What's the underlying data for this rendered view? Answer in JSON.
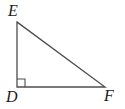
{
  "figure": {
    "kind": "right-triangle",
    "background_color": "#ffffff",
    "stroke_color": "#4d4d4d",
    "label_color": "#1a1a1a",
    "stroke_width": 1.3,
    "vertices": [
      {
        "name": "E",
        "label": "E",
        "x": 17,
        "y": 22
      },
      {
        "name": "D",
        "label": "D",
        "x": 17,
        "y": 87
      },
      {
        "name": "F",
        "label": "F",
        "x": 105,
        "y": 87
      }
    ],
    "edges": [
      {
        "name": "leg-DE",
        "from": "D",
        "to": "E"
      },
      {
        "name": "leg-DF",
        "from": "D",
        "to": "F"
      },
      {
        "name": "hypotenuse-EF",
        "from": "E",
        "to": "F"
      }
    ],
    "right_angle": {
      "at_vertex": "D",
      "marker": "square",
      "size": 8,
      "x": 17,
      "y": 79
    },
    "labels": {
      "E": "E",
      "D": "D",
      "F": "F"
    }
  }
}
